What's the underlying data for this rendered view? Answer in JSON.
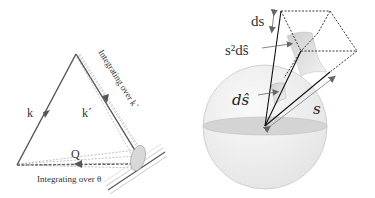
{
  "left_panel": {
    "label_k": "k",
    "label_k_prime": "k´",
    "label_Q": "Q",
    "caption_k_prime": "Integrating over k´",
    "caption_theta": "Integrating over θ"
  },
  "right_panel": {
    "label_ds": "ds",
    "label_s2_dshat": "s²dŝ",
    "label_dshat": "dŝ",
    "label_s": "s"
  },
  "colors": {
    "line": "#555555",
    "dashed": "#9a9a9a",
    "sphere_fill": "#efefef",
    "equator_fill": "#d6d6d6",
    "patch_fill": "#dcdcdc"
  }
}
